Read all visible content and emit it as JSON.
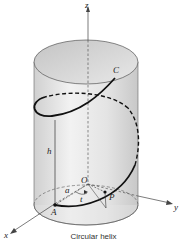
{
  "figure": {
    "caption": "Circular helix",
    "labels": {
      "z_axis": "z",
      "x_axis": "x",
      "y_axis": "y",
      "origin": "O",
      "start_point": "A",
      "end_point": "C",
      "point": "P",
      "radius": "a",
      "angle": "t",
      "height": "h"
    },
    "colors": {
      "cylinder_fill": "#d9d9d9",
      "cylinder_edge": "#555555",
      "helix": "#111111",
      "axis": "#444444"
    }
  }
}
